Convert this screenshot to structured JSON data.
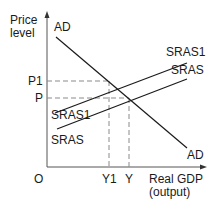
{
  "diagram": {
    "type": "AD-AS model (supply shift)",
    "y_axis_label_line1": "Price",
    "y_axis_label_line2": "level",
    "x_axis_label_line1": "Real GDP",
    "x_axis_label_line2": "(output)",
    "origin_label": "O",
    "price_levels": {
      "p1": "P1",
      "p": "P"
    },
    "outputs": {
      "y1": "Y1",
      "y": "Y"
    },
    "curves": {
      "ad_top": "AD",
      "ad_bottom": "AD",
      "sras1_right": "SRAS1",
      "sras_right": "SRAS",
      "sras1_left": "SRAS1",
      "sras_left": "SRAS"
    },
    "colors": {
      "line": "#1a1a1a",
      "axis": "#555555",
      "dash": "#8a8a8a"
    }
  }
}
